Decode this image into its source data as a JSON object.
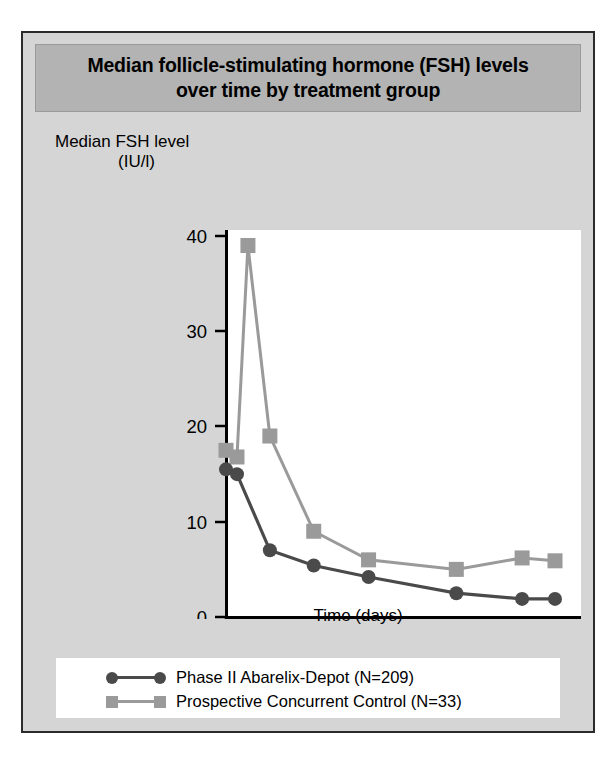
{
  "figure": {
    "title": "Median follicle-stimulating hormone (FSH) levels over time by treatment group",
    "title_line1": "Median follicle-stimulating hormone (FSH) levels",
    "title_line2": "over time by treatment group",
    "background_color": "#d5d5d5",
    "title_band_color": "#b3b3b3",
    "plot_background_color": "#ffffff",
    "border_color": "#2b2b2b"
  },
  "chart_data": {
    "type": "line",
    "title": "Median follicle-stimulating hormone (FSH) levels over time by treatment group",
    "xlabel": "Time (days)",
    "ylabel": "Median FSH level (IU/l)",
    "ylabel_line1": "Median FSH level",
    "ylabel_line2": "(IU/l)",
    "xlim": [
      0,
      31
    ],
    "ylim": [
      0,
      40
    ],
    "xticks": [
      0,
      5,
      10,
      15,
      20,
      25,
      30
    ],
    "yticks": [
      0,
      10,
      20,
      30,
      40
    ],
    "xticklabels": [
      "0",
      "5",
      "10",
      "15",
      "20",
      "25",
      "30"
    ],
    "yticklabels": [
      "0",
      "10",
      "20",
      "30",
      "40"
    ],
    "grid": false,
    "legend_position": "below-plot",
    "series": [
      {
        "name": "Phase II Abarelix-Depot (N=209)",
        "marker": "circle",
        "color": "#4a4a4a",
        "x": [
          0,
          1,
          4,
          8,
          13,
          21,
          27,
          30
        ],
        "y": [
          15.5,
          15.0,
          7.0,
          5.4,
          4.2,
          2.5,
          1.9,
          1.9
        ]
      },
      {
        "name": "Prospective Concurrent Control (N=33)",
        "marker": "square",
        "color": "#9a9a9a",
        "x": [
          0,
          1,
          2,
          4,
          8,
          13,
          21,
          27,
          30
        ],
        "y": [
          17.5,
          16.8,
          39.0,
          19.0,
          9.0,
          6.0,
          5.0,
          6.2,
          5.9
        ]
      }
    ]
  },
  "legend": {
    "items": [
      {
        "label": "Phase II Abarelix-Depot (N=209)",
        "marker": "circle",
        "color": "#4a4a4a"
      },
      {
        "label": "Prospective Concurrent Control (N=33)",
        "marker": "square",
        "color": "#9a9a9a"
      }
    ]
  }
}
